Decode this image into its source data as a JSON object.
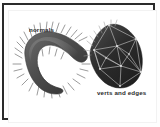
{
  "figure": {
    "background_color": "#ffffff",
    "border_color": "#2b2b2b",
    "text_color": "#2a2a2a",
    "labels": {
      "normals": "normals",
      "verts_and_edges": "verts and edges"
    },
    "objects": [
      {
        "name": "blob-with-normals",
        "description": "crescent shaped shaded blob with surface normal spikes",
        "fill_color": "#585858",
        "normal_color": "#6e6e6e"
      },
      {
        "name": "polyhedral-mesh",
        "description": "dark faceted mesh showing vertices and edges",
        "fill_color": "#303030",
        "edge_color": "#cfcfcf"
      }
    ]
  }
}
